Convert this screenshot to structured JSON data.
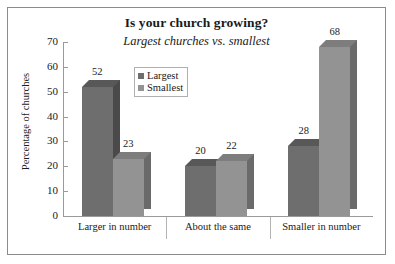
{
  "chart_data": {
    "type": "bar",
    "title": "Is your church growing?",
    "subtitle": "Largest churches vs. smallest",
    "xlabel": "",
    "ylabel": "Percentage of churches",
    "categories": [
      "Larger in number",
      "About the same",
      "Smaller in number"
    ],
    "series": [
      {
        "name": "Largest",
        "values": [
          52,
          20,
          28
        ],
        "color": "#6e6e6e"
      },
      {
        "name": "Smallest",
        "values": [
          23,
          22,
          68
        ],
        "color": "#939393"
      }
    ],
    "ylim": [
      0,
      70
    ],
    "yticks": [
      0,
      10,
      20,
      30,
      40,
      50,
      60,
      70
    ],
    "grid": false,
    "legend_position": "top-center",
    "style": "3d-column",
    "data_labels": true
  },
  "legend": {
    "items": [
      {
        "label": "Largest",
        "swatch": "#6e6e6e"
      },
      {
        "label": "Smallest",
        "swatch": "#939393"
      }
    ]
  },
  "colors": {
    "largest_front": "#6e6e6e",
    "largest_side": "#4a4a4a",
    "largest_top": "#585858",
    "smallest_front": "#939393",
    "smallest_side": "#6a6a6a",
    "smallest_top": "#7d7d7d",
    "border": "#8c8c8c",
    "axis": "#9a9a9a",
    "text": "#1a1a1a"
  }
}
